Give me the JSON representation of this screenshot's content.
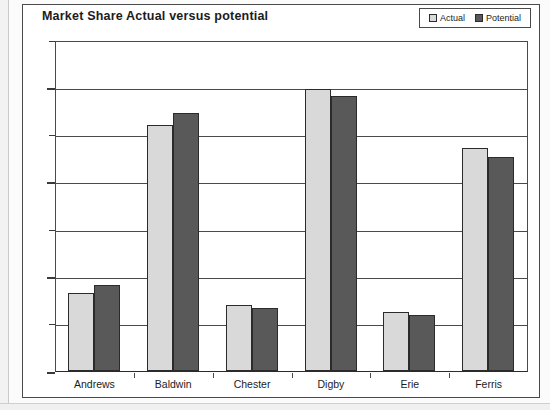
{
  "chart_data": {
    "type": "bar",
    "title": "Market Share Actual versus potential",
    "xlabel": "",
    "ylabel": "",
    "categories": [
      "Andrews",
      "Baldwin",
      "Chester",
      "Digby",
      "Erie",
      "Ferris"
    ],
    "series": [
      {
        "name": "Actual",
        "color": "#d9d9d9",
        "values": [
          8.2,
          26.0,
          7.0,
          29.8,
          6.2,
          23.6
        ]
      },
      {
        "name": "Potential",
        "color": "#595959",
        "values": [
          9.1,
          27.3,
          6.7,
          29.1,
          5.9,
          22.6
        ]
      }
    ],
    "ylim": [
      0,
      35
    ],
    "ytick_values": [
      0,
      5,
      10,
      15,
      20,
      25,
      30,
      35
    ],
    "ytick_labels": [
      "0%",
      "5%",
      "10%",
      "15%",
      "20%",
      "25%",
      "30%",
      "35%"
    ],
    "grid": "horizontal",
    "legend_position": "top-right",
    "value_unit": "percent"
  },
  "legend": {
    "items": [
      {
        "label": "Actual",
        "swatch_color": "#d9d9d9"
      },
      {
        "label": "Potential",
        "swatch_color": "#595959"
      }
    ]
  }
}
